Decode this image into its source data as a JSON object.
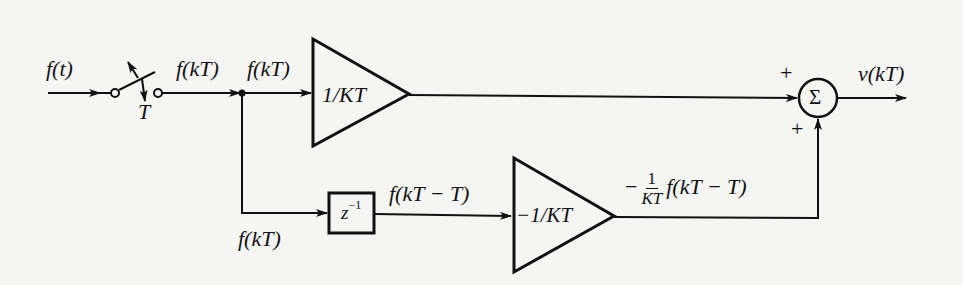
{
  "diagram": {
    "type": "block-diagram",
    "input": {
      "label": "f(t)"
    },
    "sampler": {
      "label": "T"
    },
    "signals": {
      "after_sampler": "f(kT)",
      "top_gain_in": "f(kT)",
      "bottom_branch": "f(kT)",
      "delay_out": "f(kT − T)",
      "bottom_gain_out_prefix": "−",
      "bottom_gain_out_num": "1",
      "bottom_gain_out_den": "KT",
      "bottom_gain_out_suffix": "f(kT − T)"
    },
    "blocks": {
      "top_gain": {
        "label": "1/KT"
      },
      "delay": {
        "base": "z",
        "exp": "−1"
      },
      "bottom_gain": {
        "label": "−1/KT"
      },
      "summer": {
        "label": "Σ",
        "sign_top": "+",
        "sign_bottom": "+"
      }
    },
    "output": {
      "label": "v(kT)"
    }
  }
}
